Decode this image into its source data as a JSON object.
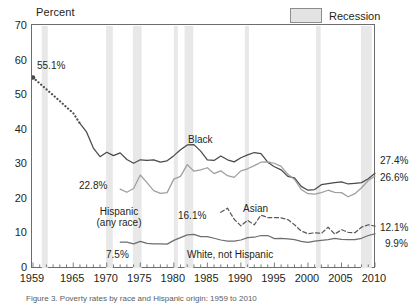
{
  "axis_title": "Percent",
  "legend": {
    "label": "Recession",
    "swatch_color": "#e3e3e3"
  },
  "caption": "Figure 3. Poverty rates by race and Hispanic origin: 1959 to 2010",
  "colors": {
    "black_line": "#4a4a4a",
    "hispanic_line": "#9e9e9e",
    "white_line": "#6e6e6e",
    "asian_line": "#5a5a5a",
    "recession_band": "#e8e8e8",
    "axis": "#6d6d6d"
  },
  "y_ticks": [
    "0",
    "10",
    "20",
    "30",
    "40",
    "50",
    "60",
    "70"
  ],
  "x_ticks": [
    "1959",
    "1965",
    "1970",
    "1975",
    "1980",
    "1985",
    "1990",
    "1995",
    "2000",
    "2005",
    "2010"
  ],
  "annotations": {
    "black_start": "55.1%",
    "black_series": "Black",
    "hispanic_start": "22.8%",
    "hispanic_series_l1": "Hispanic",
    "hispanic_series_l2": "(any race)",
    "asian_start": "16.1%",
    "asian_series": "Asian",
    "white_start": "7.5%",
    "white_series": "White, not Hispanic"
  },
  "end_labels": {
    "black": "27.4%",
    "hispanic": "26.6%",
    "asian": "12.1%",
    "white": "9.9%"
  },
  "chart_data": {
    "type": "line",
    "title": "Poverty rates by race and Hispanic origin: 1959 to 2010",
    "xlabel": "",
    "ylabel": "Percent",
    "xlim": [
      1959,
      2010
    ],
    "ylim": [
      0,
      70
    ],
    "grid": false,
    "legend_position": "top-right",
    "recessions": [
      [
        1960.3,
        1961.2
      ],
      [
        1969.9,
        1970.9
      ],
      [
        1973.9,
        1975.2
      ],
      [
        1980.0,
        1980.6
      ],
      [
        1981.6,
        1982.9
      ],
      [
        1990.6,
        1991.2
      ],
      [
        2001.2,
        2001.9
      ],
      [
        2007.9,
        2009.5
      ]
    ],
    "series": [
      {
        "name": "Black",
        "color": "#4a4a4a",
        "style": "solid-with-dotted-lead",
        "dotted_through": 1966,
        "x": [
          1959,
          1960,
          1961,
          1962,
          1963,
          1964,
          1965,
          1966,
          1967,
          1968,
          1969,
          1970,
          1971,
          1972,
          1973,
          1974,
          1975,
          1976,
          1977,
          1978,
          1979,
          1980,
          1981,
          1982,
          1983,
          1984,
          1985,
          1986,
          1987,
          1988,
          1989,
          1990,
          1991,
          1992,
          1993,
          1994,
          1995,
          1996,
          1997,
          1998,
          1999,
          2000,
          2001,
          2002,
          2003,
          2004,
          2005,
          2006,
          2007,
          2008,
          2009,
          2010
        ],
        "y": [
          55.1,
          53.4,
          51.7,
          50.0,
          48.3,
          46.5,
          44.8,
          41.8,
          39.3,
          34.7,
          32.2,
          33.5,
          32.5,
          33.3,
          31.4,
          30.3,
          31.3,
          31.1,
          31.3,
          30.6,
          31.0,
          32.5,
          34.2,
          35.6,
          35.7,
          33.8,
          31.3,
          31.1,
          32.4,
          31.3,
          30.7,
          31.9,
          32.7,
          33.4,
          33.1,
          30.6,
          29.3,
          28.4,
          26.5,
          26.1,
          23.6,
          22.5,
          22.7,
          24.1,
          24.4,
          24.7,
          24.9,
          24.3,
          24.5,
          24.7,
          25.8,
          27.4
        ]
      },
      {
        "name": "Hispanic (any race)",
        "color": "#9e9e9e",
        "style": "solid",
        "x": [
          1972,
          1973,
          1974,
          1975,
          1976,
          1977,
          1978,
          1979,
          1980,
          1981,
          1982,
          1983,
          1984,
          1985,
          1986,
          1987,
          1988,
          1989,
          1990,
          1991,
          1992,
          1993,
          1994,
          1995,
          1996,
          1997,
          1998,
          1999,
          2000,
          2001,
          2002,
          2003,
          2004,
          2005,
          2006,
          2007,
          2008,
          2009,
          2010
        ],
        "y": [
          22.8,
          21.9,
          23.0,
          26.9,
          24.7,
          22.4,
          21.6,
          21.8,
          25.7,
          26.5,
          29.9,
          28.0,
          28.4,
          29.0,
          27.3,
          28.1,
          26.7,
          26.2,
          28.1,
          28.7,
          29.6,
          30.6,
          30.7,
          30.3,
          29.4,
          27.1,
          25.6,
          22.7,
          21.5,
          21.4,
          21.8,
          22.5,
          21.9,
          21.8,
          20.6,
          21.5,
          23.2,
          25.3,
          26.6
        ]
      },
      {
        "name": "Asian",
        "color": "#5a5a5a",
        "style": "dashed",
        "x": [
          1987,
          1988,
          1989,
          1990,
          1991,
          1992,
          1993,
          1994,
          1995,
          1996,
          1997,
          1998,
          1999,
          2000,
          2001,
          2002,
          2003,
          2004,
          2005,
          2006,
          2007,
          2008,
          2009,
          2010
        ],
        "y": [
          16.1,
          17.3,
          14.1,
          12.2,
          13.8,
          12.5,
          15.3,
          14.6,
          14.6,
          14.5,
          14.0,
          12.5,
          10.7,
          9.9,
          10.2,
          10.0,
          11.8,
          9.8,
          11.1,
          10.3,
          10.2,
          11.8,
          12.5,
          12.1
        ]
      },
      {
        "name": "White, not Hispanic",
        "color": "#6e6e6e",
        "style": "solid",
        "x": [
          1972,
          1973,
          1974,
          1975,
          1976,
          1977,
          1978,
          1979,
          1980,
          1981,
          1982,
          1983,
          1984,
          1985,
          1986,
          1987,
          1988,
          1989,
          1990,
          1991,
          1992,
          1993,
          1994,
          1995,
          1996,
          1997,
          1998,
          1999,
          2000,
          2001,
          2002,
          2003,
          2004,
          2005,
          2006,
          2007,
          2008,
          2009,
          2010
        ],
        "y": [
          7.5,
          7.5,
          7.0,
          7.7,
          7.1,
          7.0,
          7.0,
          6.9,
          8.0,
          8.8,
          9.6,
          9.7,
          9.1,
          9.1,
          8.6,
          8.1,
          7.8,
          7.8,
          8.1,
          8.8,
          8.9,
          9.4,
          9.4,
          8.5,
          8.6,
          8.4,
          8.2,
          7.7,
          7.4,
          7.8,
          8.0,
          8.2,
          8.6,
          8.3,
          8.2,
          8.2,
          8.6,
          9.4,
          9.9
        ]
      }
    ]
  }
}
